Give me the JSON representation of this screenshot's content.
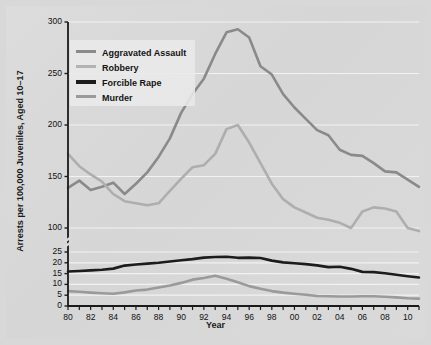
{
  "chart_data": {
    "type": "line",
    "title": "",
    "xlabel": "Year",
    "ylabel": "Arrests per 100,000 Juveniles, Aged 10–17",
    "grid": true,
    "legend_position": "upper-left-inside",
    "axis_note": "Broken y-axis: lower band 0–25 (ticks 0,5,10,15,20,25), upper band 100–300 (ticks 100,150,200,250,300)",
    "x": [
      80,
      81,
      82,
      83,
      84,
      85,
      86,
      87,
      88,
      89,
      90,
      91,
      92,
      93,
      94,
      95,
      96,
      97,
      98,
      99,
      "00",
      "01",
      "02",
      "03",
      "04",
      "05",
      "06",
      "07",
      "08",
      "09",
      10,
      11
    ],
    "xtick_labels": [
      "80",
      "82",
      "84",
      "86",
      "88",
      "90",
      "92",
      "94",
      "96",
      "98",
      "00",
      "02",
      "04",
      "06",
      "08",
      "10"
    ],
    "ytick_labels_upper": [
      "300",
      "250",
      "200",
      "150",
      "100"
    ],
    "ytick_labels_lower": [
      "25",
      "20",
      "15",
      "10",
      "5",
      "0"
    ],
    "ylim_upper": [
      100,
      300
    ],
    "ylim_lower": [
      0,
      25
    ],
    "series": [
      {
        "name": "Aggravated Assault",
        "color": "#8a8a8a",
        "width": 2.6,
        "band": "upper",
        "values": [
          139,
          146,
          137,
          140,
          144,
          133,
          143,
          154,
          169,
          187,
          212,
          230,
          245,
          269,
          290,
          293,
          285,
          257,
          249,
          230,
          217,
          206,
          195,
          190,
          176,
          171,
          170,
          163,
          155,
          154,
          147,
          140
        ]
      },
      {
        "name": "Robbery",
        "color": "#aeaeae",
        "width": 2.6,
        "band": "upper",
        "values": [
          172,
          160,
          152,
          145,
          133,
          126,
          124,
          122,
          124,
          136,
          148,
          159,
          161,
          172,
          196,
          200,
          183,
          163,
          143,
          128,
          120,
          115,
          110,
          108,
          105,
          100,
          116,
          120,
          119,
          116,
          100,
          97
        ]
      },
      {
        "name": "Forcible Rape",
        "color": "#1c1c1c",
        "width": 2.6,
        "band": "lower",
        "values": [
          16.0,
          16.2,
          16.5,
          16.8,
          17.3,
          18.7,
          19.2,
          19.6,
          20.0,
          20.6,
          21.2,
          21.7,
          22.4,
          22.7,
          22.8,
          22.3,
          22.4,
          22.2,
          21.0,
          20.2,
          19.8,
          19.4,
          18.8,
          18.0,
          18.2,
          17.2,
          15.8,
          15.7,
          15.2,
          14.5,
          13.8,
          13.2
        ]
      },
      {
        "name": "Murder",
        "color": "#9a9a9a",
        "width": 2.6,
        "band": "lower",
        "values": [
          6.9,
          6.6,
          6.2,
          5.9,
          5.7,
          6.3,
          7.2,
          7.6,
          8.6,
          9.5,
          10.7,
          12.2,
          13.0,
          14.0,
          12.6,
          11.0,
          9.2,
          8.0,
          6.9,
          6.2,
          5.7,
          5.2,
          4.6,
          4.5,
          4.4,
          4.4,
          4.5,
          4.5,
          4.3,
          4.0,
          3.6,
          3.4
        ]
      }
    ],
    "legend_entries": [
      {
        "label": "Aggravated Assault",
        "color": "#8a8a8a",
        "thickness": 3
      },
      {
        "label": "Robbery",
        "color": "#b3b3b3",
        "thickness": 3
      },
      {
        "label": "Forcible Rape",
        "color": "#1c1c1c",
        "thickness": 4
      },
      {
        "label": "Murder",
        "color": "#9a9a9a",
        "thickness": 3
      }
    ]
  },
  "figure": {
    "background": "#d8d8d8",
    "plot_background": "#dadada",
    "gridline_color": "#f2f2f2",
    "axis_color": "#1a1a1a"
  }
}
